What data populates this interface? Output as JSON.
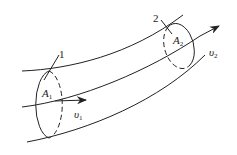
{
  "diagram": {
    "section1": {
      "marker": "1",
      "area_label": "A",
      "area_sub": "1",
      "velocity_label": "υ",
      "velocity_sub": "1"
    },
    "section2": {
      "marker": "2",
      "area_label": "A",
      "area_sub": "2",
      "velocity_label": "υ",
      "velocity_sub": "2"
    },
    "stroke_color": "#222222"
  }
}
